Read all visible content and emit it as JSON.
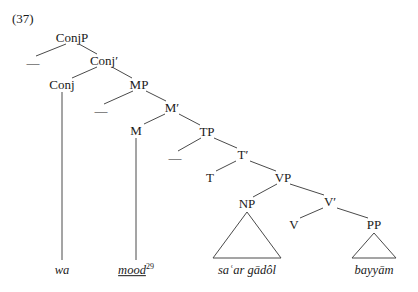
{
  "example": {
    "number": "(37)"
  },
  "tree": {
    "nodes": [
      {
        "id": "ConjP",
        "label": "ConjP",
        "x": 72,
        "y": 37
      },
      {
        "id": "ConjBar",
        "label": "Conj′",
        "x": 104,
        "y": 60
      },
      {
        "id": "Conj",
        "label": "Conj",
        "x": 62,
        "y": 84
      },
      {
        "id": "MP",
        "label": "MP",
        "x": 139,
        "y": 84
      },
      {
        "id": "MBar",
        "label": "M′",
        "x": 172,
        "y": 107
      },
      {
        "id": "M",
        "label": "M",
        "x": 136,
        "y": 130
      },
      {
        "id": "TP",
        "label": "TP",
        "x": 207,
        "y": 131
      },
      {
        "id": "TBar",
        "label": "T′",
        "x": 243,
        "y": 154
      },
      {
        "id": "T",
        "label": "T",
        "x": 210,
        "y": 177
      },
      {
        "id": "VP",
        "label": "VP",
        "x": 283,
        "y": 177
      },
      {
        "id": "NP",
        "label": "NP",
        "x": 247,
        "y": 203
      },
      {
        "id": "VBar",
        "label": "V′",
        "x": 330,
        "y": 201
      },
      {
        "id": "V",
        "label": "V",
        "x": 294,
        "y": 224
      },
      {
        "id": "PP",
        "label": "PP",
        "x": 374,
        "y": 224
      }
    ],
    "empty_specifiers": [
      {
        "id": "spec-conjp",
        "mark": "—",
        "x": 33,
        "y": 62
      },
      {
        "id": "spec-mp",
        "mark": "—",
        "x": 101,
        "y": 110
      },
      {
        "id": "spec-tp",
        "mark": "—",
        "x": 175,
        "y": 157
      }
    ],
    "terminals": [
      {
        "id": "wa",
        "text": "wa",
        "x": 62,
        "y": 270,
        "underlined": false,
        "footnote": ""
      },
      {
        "id": "mood",
        "text": "mood",
        "x": 136,
        "y": 270,
        "underlined": true,
        "footnote": "29"
      },
      {
        "id": "saar",
        "text": "saʿar gādôl",
        "x": 247,
        "y": 270,
        "underlined": false,
        "footnote": ""
      },
      {
        "id": "bayyam",
        "text": "bayyām",
        "x": 374,
        "y": 270,
        "underlined": false,
        "footnote": ""
      }
    ],
    "triangles": [
      {
        "id": "np-triangle",
        "apex_x": 247,
        "apex_y": 212,
        "left_x": 213,
        "right_x": 281,
        "base_y": 258
      },
      {
        "id": "pp-triangle",
        "apex_x": 374,
        "apex_y": 233,
        "left_x": 352,
        "right_x": 396,
        "base_y": 258
      }
    ],
    "edges": [
      {
        "id": "conjp-spec",
        "x1": 66,
        "y1": 44,
        "x2": 36,
        "y2": 56
      },
      {
        "id": "conjp-conjbar",
        "x1": 79,
        "y1": 44,
        "x2": 97,
        "y2": 54
      },
      {
        "id": "conjbar-conj",
        "x1": 97,
        "y1": 67,
        "x2": 72,
        "y2": 78
      },
      {
        "id": "conjbar-mp",
        "x1": 112,
        "y1": 67,
        "x2": 132,
        "y2": 78
      },
      {
        "id": "mp-spec",
        "x1": 133,
        "y1": 91,
        "x2": 104,
        "y2": 104
      },
      {
        "id": "mp-mbar",
        "x1": 146,
        "y1": 91,
        "x2": 166,
        "y2": 101
      },
      {
        "id": "mbar-m",
        "x1": 165,
        "y1": 114,
        "x2": 144,
        "y2": 124
      },
      {
        "id": "mbar-tp",
        "x1": 179,
        "y1": 114,
        "x2": 200,
        "y2": 125
      },
      {
        "id": "tp-spec",
        "x1": 201,
        "y1": 138,
        "x2": 178,
        "y2": 151
      },
      {
        "id": "tp-tbar",
        "x1": 214,
        "y1": 138,
        "x2": 237,
        "y2": 148
      },
      {
        "id": "tbar-t",
        "x1": 236,
        "y1": 161,
        "x2": 216,
        "y2": 171
      },
      {
        "id": "tbar-vp",
        "x1": 250,
        "y1": 161,
        "x2": 276,
        "y2": 171
      },
      {
        "id": "vp-np",
        "x1": 277,
        "y1": 184,
        "x2": 253,
        "y2": 197
      },
      {
        "id": "vp-vbar",
        "x1": 290,
        "y1": 184,
        "x2": 324,
        "y2": 195
      },
      {
        "id": "vbar-v",
        "x1": 323,
        "y1": 208,
        "x2": 300,
        "y2": 218
      },
      {
        "id": "vbar-pp",
        "x1": 337,
        "y1": 208,
        "x2": 368,
        "y2": 218
      },
      {
        "id": "conj-wa",
        "x1": 62,
        "y1": 92,
        "x2": 62,
        "y2": 260
      },
      {
        "id": "m-mood",
        "x1": 136,
        "y1": 138,
        "x2": 136,
        "y2": 260
      }
    ]
  },
  "style": {
    "line_color": "#4a4a4a",
    "text_color": "#1a1a1a",
    "background": "#ffffff"
  }
}
